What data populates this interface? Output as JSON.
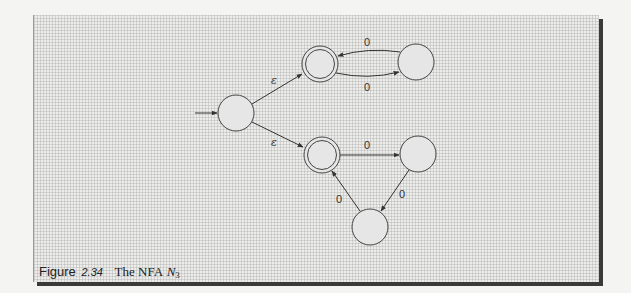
{
  "figure": {
    "label": "Figure",
    "number": "2.34",
    "title": "The NFA",
    "math_symbol": "N",
    "math_subscript": "3"
  },
  "automaton": {
    "start_state": "q0",
    "states": [
      {
        "id": "q0",
        "cx": 236,
        "cy": 113,
        "accepting": false
      },
      {
        "id": "q1",
        "cx": 320,
        "cy": 64,
        "accepting": true
      },
      {
        "id": "q2",
        "cx": 416,
        "cy": 62,
        "accepting": false
      },
      {
        "id": "q3",
        "cx": 322,
        "cy": 155,
        "accepting": true
      },
      {
        "id": "q4",
        "cx": 418,
        "cy": 154,
        "accepting": false
      },
      {
        "id": "q5",
        "cx": 370,
        "cy": 227,
        "accepting": false
      }
    ],
    "transitions": [
      {
        "from": "q0",
        "to": "q1",
        "label": "ε"
      },
      {
        "from": "q0",
        "to": "q3",
        "label": "ε"
      },
      {
        "from": "q1",
        "to": "q2",
        "label": "0"
      },
      {
        "from": "q2",
        "to": "q1",
        "label": "0"
      },
      {
        "from": "q3",
        "to": "q4",
        "label": "0"
      },
      {
        "from": "q4",
        "to": "q5",
        "label": "0"
      },
      {
        "from": "q5",
        "to": "q3",
        "label": "0"
      }
    ]
  },
  "labels": {
    "eps_upper": "ε",
    "eps_lower": "ε",
    "q2_to_q1": "0",
    "q1_to_q2": "0",
    "q3_to_q4": "0",
    "q4_to_q5": "0",
    "q5_to_q3": "0"
  }
}
